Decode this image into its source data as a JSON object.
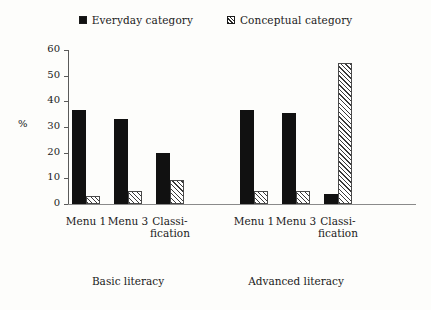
{
  "legend": {
    "items": [
      {
        "label": "Everyday category",
        "swatch": "solid-square-icon",
        "color": "#111111"
      },
      {
        "label": "Conceptual category",
        "swatch": "hatched-square-icon",
        "color": "#ffffff"
      }
    ]
  },
  "axis": {
    "y_title": "%",
    "y_ticks": [
      "0",
      "10",
      "20",
      "30",
      "40",
      "50",
      "60"
    ]
  },
  "groups": [
    {
      "label": "Basic literacy",
      "categories": [
        "Menu 1",
        "Menu 3",
        "Classi-\nfication"
      ]
    },
    {
      "label": "Advanced literacy",
      "categories": [
        "Menu 1",
        "Menu 3",
        "Classi-\nfication"
      ]
    }
  ],
  "chart_data": {
    "type": "bar",
    "title": "",
    "xlabel": "",
    "ylabel": "%",
    "ylim": [
      0,
      60
    ],
    "yticks": [
      0,
      10,
      20,
      30,
      40,
      50,
      60
    ],
    "grid": false,
    "legend_position": "top-center",
    "categories": [
      "Basic literacy / Menu 1",
      "Basic literacy / Menu 3",
      "Basic literacy / Classification",
      "Advanced literacy / Menu 1",
      "Advanced literacy / Menu 3",
      "Advanced literacy / Classification"
    ],
    "series": [
      {
        "name": "Everyday category",
        "values": [
          36.5,
          33,
          20,
          36.5,
          35.5,
          4
        ]
      },
      {
        "name": "Conceptual category",
        "values": [
          3,
          5,
          9.5,
          5,
          5,
          55
        ]
      }
    ]
  }
}
